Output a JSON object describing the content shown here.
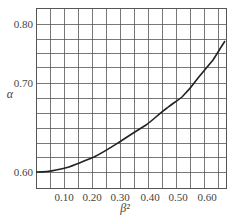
{
  "chart_data": {
    "type": "line",
    "title": "",
    "xlabel": "β²",
    "ylabel": "α",
    "xlim": [
      0,
      0.68
    ],
    "ylim": [
      0.59,
      0.82
    ],
    "grid": true,
    "legend": null,
    "x_ticks": [
      "0.10",
      "0.20",
      "0.30",
      "0.40",
      "0.50",
      "0.60"
    ],
    "y_ticks": [
      "0.60",
      "0.70",
      "0.80"
    ],
    "series": [
      {
        "name": "α vs β²",
        "x": [
          0.0,
          0.05,
          0.1,
          0.15,
          0.2,
          0.25,
          0.3,
          0.35,
          0.4,
          0.45,
          0.5,
          0.55,
          0.6,
          0.65
        ],
        "y": [
          0.6,
          0.601,
          0.604,
          0.609,
          0.615,
          0.622,
          0.63,
          0.638,
          0.648,
          0.659,
          0.672,
          0.692,
          0.725,
          0.765
        ]
      }
    ]
  },
  "layout": {
    "plot": {
      "left": 36,
      "top": 8,
      "right": 226,
      "bottom": 188
    },
    "x_gridlines_px": [
      36,
      50,
      64,
      78,
      92,
      106,
      120,
      134,
      148,
      162,
      176,
      190,
      204,
      218
    ],
    "y_gridlines_px": [
      24,
      39,
      53,
      67,
      83,
      98,
      113,
      128,
      143,
      157,
      172
    ],
    "x_tick_px": [
      64,
      92,
      120,
      150,
      178,
      207
    ],
    "y_tick_px": [
      172,
      83,
      24
    ],
    "curve_px": "M36,172 C46,172 52,171 56,170 C62,169 66,168 69,167 C78,164 86,160 94,157 C104,152 113,146 121,141 C130,135 138,130 146,125 C153,120 160,113 167,108 C172,104 177,101 182,97 C188,91 193,85 198,78 C203,72 208,66 213,60 C217,54 221,47 225,41",
    "colors": {
      "grid": "#555555",
      "curve": "#222222",
      "text": "#444444"
    }
  }
}
